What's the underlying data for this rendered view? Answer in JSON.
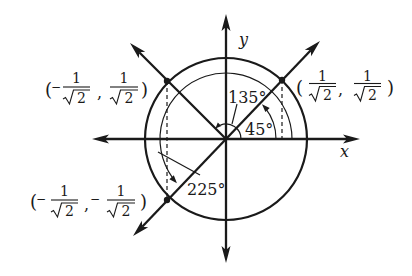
{
  "figure": {
    "axes": {
      "x_label": "x",
      "y_label": "y"
    },
    "angles": [
      {
        "label": "45°"
      },
      {
        "label": "135°"
      },
      {
        "label": "225°"
      }
    ],
    "points": [
      {
        "expression": "(1/√2, 1/√2)",
        "open": "(",
        "close": ")",
        "sep": ",",
        "x_sign": "",
        "x_num": "1",
        "x_den": "2",
        "y_sign": "",
        "y_num": "1",
        "y_den": "2"
      },
      {
        "expression": "(−1/√2, 1/√2)",
        "open": "(",
        "close": ")",
        "sep": ",",
        "x_sign": "−",
        "x_num": "1",
        "x_den": "2",
        "y_sign": "",
        "y_num": "1",
        "y_den": "2"
      },
      {
        "expression": "(−1/√2, −1/√2)",
        "open": "(",
        "close": ")",
        "sep": ",",
        "x_sign": "−",
        "x_num": "1",
        "x_den": "2",
        "y_sign": "−",
        "y_num": "1",
        "y_den": "2"
      }
    ]
  },
  "colors": {
    "ink": "#1a1a1a",
    "background": "#ffffff"
  }
}
